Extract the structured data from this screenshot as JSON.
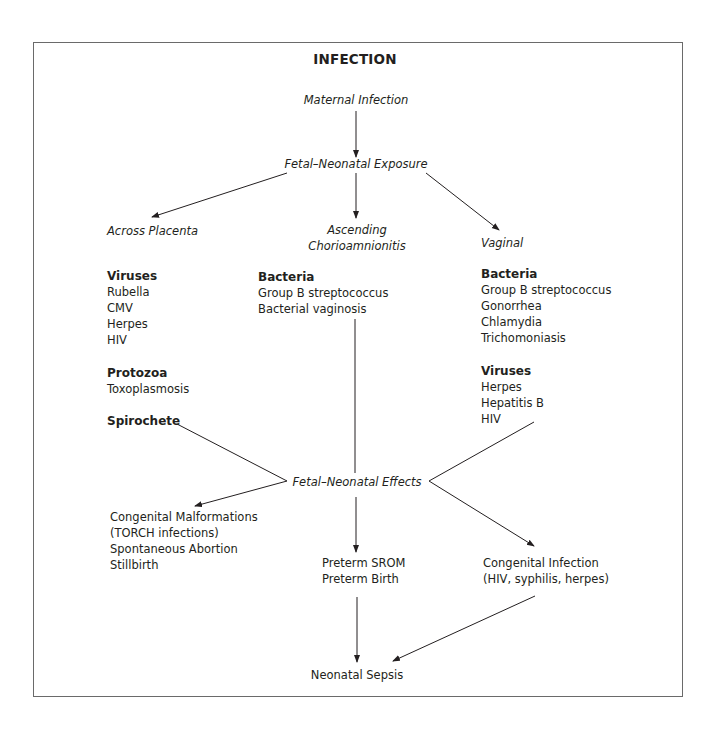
{
  "title": "INFECTION",
  "nodes": {
    "maternal_infection": "Maternal Infection",
    "exposure": "Fetal–Neonatal Exposure",
    "effects": "Fetal–Neonatal Effects",
    "neonatal_sepsis": "Neonatal Sepsis"
  },
  "routes": {
    "placenta": {
      "label": "Across Placenta",
      "groups": [
        {
          "heading": "Viruses",
          "items": [
            "Rubella",
            "CMV",
            "Herpes",
            "HIV"
          ]
        },
        {
          "heading": "Protozoa",
          "items": [
            "Toxoplasmosis"
          ]
        },
        {
          "heading": "Spirochete",
          "items": []
        }
      ]
    },
    "ascending": {
      "label_line1": "Ascending",
      "label_line2": "Chorioamnionitis",
      "groups": [
        {
          "heading": "Bacteria",
          "items": [
            "Group B streptococcus",
            "Bacterial vaginosis"
          ]
        }
      ]
    },
    "vaginal": {
      "label": "Vaginal",
      "groups": [
        {
          "heading": "Bacteria",
          "items": [
            "Group B streptococcus",
            "Gonorrhea",
            "Chlamydia",
            "Trichomoniasis"
          ]
        },
        {
          "heading": "Viruses",
          "items": [
            "Herpes",
            "Hepatitis B",
            "HIV"
          ]
        }
      ]
    }
  },
  "outcomes": {
    "left": [
      "Congenital Malformations",
      "(TORCH infections)",
      "Spontaneous Abortion",
      "Stillbirth"
    ],
    "middle": [
      "Preterm SROM",
      "Preterm Birth"
    ],
    "right": [
      "Congenital Infection",
      "(HIV, syphilis, herpes)"
    ]
  }
}
